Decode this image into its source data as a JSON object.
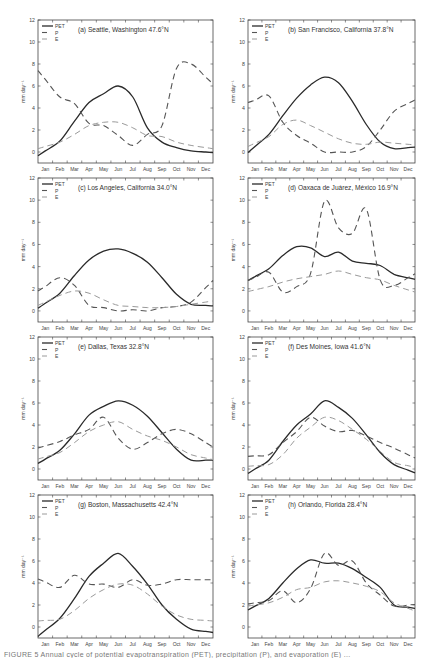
{
  "chart_data": [
    {
      "type": "line",
      "panel": "a",
      "title": "(a) Seattle, Washington 47.6°N",
      "xlabel": "",
      "ylabel": "mm day⁻¹",
      "ylim": [
        -1,
        12
      ],
      "yticks": [
        0,
        2,
        4,
        6,
        8,
        10,
        12
      ],
      "categories": [
        "Jan",
        "Feb",
        "Mar",
        "Apr",
        "May",
        "Jun",
        "Jul",
        "Aug",
        "Sep",
        "Oct",
        "Nov",
        "Dec"
      ],
      "legend": [
        "PET",
        "P",
        "E"
      ],
      "legend_position": "upper left",
      "grid": false,
      "series": [
        {
          "name": "PET",
          "style": "solid",
          "values": [
            0.1,
            1.0,
            2.8,
            4.5,
            5.3,
            6.0,
            5.0,
            2.2,
            0.9,
            0.4,
            0.1,
            0.0
          ]
        },
        {
          "name": "P",
          "style": "dashed",
          "values": [
            6.6,
            5.0,
            4.4,
            2.6,
            2.4,
            1.5,
            0.6,
            1.6,
            2.4,
            7.6,
            8.0,
            6.8
          ]
        },
        {
          "name": "E",
          "style": "dashed-light",
          "values": [
            0.5,
            0.9,
            1.6,
            2.4,
            2.7,
            2.7,
            2.2,
            1.5,
            1.4,
            0.9,
            0.6,
            0.4
          ]
        }
      ]
    },
    {
      "type": "line",
      "panel": "b",
      "title": "(b) San Francisco, California 37.8°N",
      "xlabel": "",
      "ylabel": "mm day⁻¹",
      "ylim": [
        -1,
        12
      ],
      "yticks": [
        0,
        2,
        4,
        6,
        8,
        10,
        12
      ],
      "categories": [
        "Jan",
        "Feb",
        "Mar",
        "Apr",
        "May",
        "Jun",
        "Jul",
        "Aug",
        "Sep",
        "Oct",
        "Nov",
        "Dec"
      ],
      "legend": [
        "PET",
        "P",
        "E"
      ],
      "legend_position": "upper left",
      "grid": false,
      "series": [
        {
          "name": "PET",
          "style": "solid",
          "values": [
            0.5,
            1.6,
            3.3,
            4.9,
            6.1,
            6.8,
            6.3,
            4.6,
            2.5,
            0.9,
            0.3,
            0.4
          ]
        },
        {
          "name": "P",
          "style": "dashed",
          "values": [
            4.7,
            5.1,
            2.7,
            1.5,
            0.8,
            0.0,
            0.0,
            0.0,
            0.5,
            2.0,
            3.7,
            4.4
          ]
        },
        {
          "name": "E",
          "style": "dashed-light",
          "values": [
            0.8,
            1.4,
            2.5,
            2.9,
            2.4,
            1.8,
            1.2,
            0.8,
            0.7,
            0.9,
            0.8,
            0.7
          ]
        }
      ]
    },
    {
      "type": "line",
      "panel": "c",
      "title": "(c) Los Angeles, California 34.0°N",
      "xlabel": "",
      "ylabel": "mm day⁻¹",
      "ylim": [
        -1,
        12
      ],
      "yticks": [
        0,
        2,
        4,
        6,
        8,
        10,
        12
      ],
      "categories": [
        "Jan",
        "Feb",
        "Mar",
        "Apr",
        "May",
        "Jun",
        "Jul",
        "Aug",
        "Sep",
        "Oct",
        "Nov",
        "Dec"
      ],
      "legend": [
        "PET",
        "P",
        "E"
      ],
      "legend_position": "upper left",
      "grid": false,
      "series": [
        {
          "name": "PET",
          "style": "solid",
          "values": [
            0.7,
            1.6,
            3.2,
            4.6,
            5.4,
            5.6,
            5.2,
            4.4,
            3.0,
            1.5,
            0.6,
            0.5
          ]
        },
        {
          "name": "P",
          "style": "dashed",
          "values": [
            2.2,
            3.0,
            2.3,
            0.5,
            0.3,
            0.0,
            0.1,
            0.0,
            0.3,
            0.4,
            0.8,
            2.1
          ]
        },
        {
          "name": "E",
          "style": "dashed-light",
          "values": [
            0.8,
            1.4,
            1.8,
            1.6,
            1.0,
            0.5,
            0.4,
            0.3,
            0.3,
            0.4,
            0.6,
            0.8
          ]
        }
      ]
    },
    {
      "type": "line",
      "panel": "d",
      "title": "(d) Oaxaca de Juárez, México 16.9°N",
      "xlabel": "",
      "ylabel": "mm day⁻¹",
      "ylim": [
        -1,
        12
      ],
      "yticks": [
        0,
        2,
        4,
        6,
        8,
        10,
        12
      ],
      "categories": [
        "Jan",
        "Feb",
        "Mar",
        "Apr",
        "May",
        "Jun",
        "Jul",
        "Aug",
        "Sep",
        "Oct",
        "Nov",
        "Dec"
      ],
      "legend": [
        "PET",
        "P",
        "E"
      ],
      "legend_position": "upper left",
      "grid": false,
      "series": [
        {
          "name": "PET",
          "style": "solid",
          "values": [
            3.1,
            3.8,
            5.0,
            5.8,
            5.7,
            4.9,
            5.3,
            4.5,
            4.3,
            4.1,
            3.3,
            3.0
          ]
        },
        {
          "name": "P",
          "style": "dashed",
          "values": [
            3.0,
            3.5,
            1.7,
            2.2,
            3.4,
            9.9,
            7.5,
            7.0,
            9.2,
            2.8,
            2.3,
            3.0
          ]
        },
        {
          "name": "E",
          "style": "dashed-light",
          "values": [
            1.9,
            2.2,
            2.6,
            2.9,
            3.1,
            3.3,
            3.6,
            3.3,
            3.0,
            2.8,
            2.3,
            1.9
          ]
        }
      ]
    },
    {
      "type": "line",
      "panel": "e",
      "title": "(e) Dallas, Texas 32.8°N",
      "xlabel": "",
      "ylabel": "mm day⁻¹",
      "ylim": [
        -1,
        12
      ],
      "yticks": [
        0,
        2,
        4,
        6,
        8,
        10,
        12
      ],
      "categories": [
        "Jan",
        "Feb",
        "Mar",
        "Apr",
        "May",
        "Jun",
        "Jul",
        "Aug",
        "Sep",
        "Oct",
        "Nov",
        "Dec"
      ],
      "legend": [
        "PET",
        "P",
        "E"
      ],
      "legend_position": "upper left",
      "grid": false,
      "series": [
        {
          "name": "PET",
          "style": "solid",
          "values": [
            0.9,
            1.7,
            3.2,
            4.9,
            5.7,
            6.2,
            5.8,
            4.8,
            3.3,
            1.8,
            0.8,
            0.8
          ]
        },
        {
          "name": "P",
          "style": "dashed",
          "values": [
            2.1,
            2.5,
            3.1,
            3.6,
            4.7,
            2.8,
            1.8,
            2.4,
            3.2,
            3.6,
            3.2,
            2.4
          ]
        },
        {
          "name": "E",
          "style": "dashed-light",
          "values": [
            1.1,
            1.5,
            2.4,
            3.4,
            4.0,
            4.3,
            3.6,
            3.0,
            2.6,
            2.0,
            1.3,
            1.0
          ]
        }
      ]
    },
    {
      "type": "line",
      "panel": "f",
      "title": "(f) Des Moines, Iowa 41.6°N",
      "xlabel": "",
      "ylabel": "mm day⁻¹",
      "ylim": [
        -1,
        12
      ],
      "yticks": [
        0,
        2,
        4,
        6,
        8,
        10,
        12
      ],
      "categories": [
        "Jan",
        "Feb",
        "Mar",
        "Apr",
        "May",
        "Jun",
        "Jul",
        "Aug",
        "Sep",
        "Oct",
        "Nov",
        "Dec"
      ],
      "legend": [
        "PET",
        "P",
        "E"
      ],
      "legend_position": "upper left",
      "grid": false,
      "series": [
        {
          "name": "PET",
          "style": "solid",
          "values": [
            0.0,
            0.8,
            2.5,
            4.0,
            5.0,
            6.2,
            5.6,
            4.6,
            3.1,
            1.5,
            0.4,
            -0.1
          ]
        },
        {
          "name": "P",
          "style": "dashed",
          "values": [
            1.2,
            1.3,
            2.4,
            3.4,
            4.7,
            3.9,
            3.4,
            3.5,
            3.0,
            2.4,
            1.9,
            1.3
          ]
        },
        {
          "name": "E",
          "style": "dashed-light",
          "values": [
            0.3,
            0.4,
            1.3,
            2.8,
            3.8,
            4.7,
            4.4,
            3.6,
            2.7,
            1.6,
            0.6,
            0.3
          ]
        }
      ]
    },
    {
      "type": "line",
      "panel": "g",
      "title": "(g) Boston, Massachusetts 42.4°N",
      "xlabel": "",
      "ylabel": "mm day⁻¹",
      "ylim": [
        -1,
        12
      ],
      "yticks": [
        0,
        2,
        4,
        6,
        8,
        10,
        12
      ],
      "categories": [
        "Jan",
        "Feb",
        "Mar",
        "Apr",
        "May",
        "Jun",
        "Jul",
        "Aug",
        "Sep",
        "Oct",
        "Nov",
        "Dec"
      ],
      "legend": [
        "PET",
        "P",
        "E"
      ],
      "legend_position": "upper left",
      "grid": false,
      "series": [
        {
          "name": "PET",
          "style": "solid",
          "values": [
            -0.3,
            0.8,
            2.6,
            4.6,
            5.8,
            6.7,
            5.5,
            3.9,
            2.0,
            0.7,
            -0.2,
            -0.4
          ]
        },
        {
          "name": "P",
          "style": "dashed",
          "values": [
            4.1,
            3.6,
            4.7,
            3.9,
            3.9,
            3.6,
            4.3,
            3.8,
            3.9,
            4.3,
            4.3,
            4.3
          ]
        },
        {
          "name": "E",
          "style": "dashed-light",
          "values": [
            0.6,
            0.7,
            1.5,
            2.6,
            3.4,
            3.9,
            3.8,
            3.0,
            1.9,
            1.1,
            0.7,
            0.6
          ]
        }
      ]
    },
    {
      "type": "line",
      "panel": "h",
      "title": "(h) Orlando, Florida 28.4°N",
      "xlabel": "",
      "ylabel": "mm day⁻¹",
      "ylim": [
        -1,
        12
      ],
      "yticks": [
        0,
        2,
        4,
        6,
        8,
        10,
        12
      ],
      "categories": [
        "Jan",
        "Feb",
        "Mar",
        "Apr",
        "May",
        "Jun",
        "Jul",
        "Aug",
        "Sep",
        "Oct",
        "Nov",
        "Dec"
      ],
      "legend": [
        "PET",
        "P",
        "E"
      ],
      "legend_position": "upper left",
      "grid": false,
      "series": [
        {
          "name": "PET",
          "style": "solid",
          "values": [
            1.9,
            2.6,
            4.0,
            5.3,
            6.1,
            5.8,
            5.8,
            5.3,
            4.5,
            3.6,
            2.0,
            1.8
          ]
        },
        {
          "name": "P",
          "style": "dashed",
          "values": [
            2.2,
            2.4,
            3.3,
            2.2,
            3.5,
            6.7,
            5.6,
            6.0,
            4.0,
            2.9,
            1.9,
            2.0
          ]
        },
        {
          "name": "E",
          "style": "dashed-light",
          "values": [
            2.0,
            2.2,
            2.7,
            3.4,
            3.6,
            4.1,
            4.2,
            4.0,
            3.7,
            3.2,
            2.2,
            1.7
          ]
        }
      ]
    }
  ],
  "figure": {
    "ylabel": "mm day⁻¹",
    "legend_labels": {
      "pet": "PET",
      "p": "P",
      "e": "E"
    },
    "caption_visible_fragment": "FIGURE 5 Annual cycle of potential evapotranspiration (PET), precipitation (P), and evaporation (E) ..."
  },
  "colors": {
    "pet": "#2a2a2a",
    "p": "#555555",
    "e": "#9a9a9a",
    "axis": "#444444",
    "text": "#444444"
  }
}
